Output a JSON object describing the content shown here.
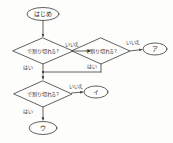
{
  "diagram": {
    "type": "flowchart",
    "title": "",
    "language": "ja",
    "style": {
      "stroke_color": "#3a3a3a",
      "text_color": "#2b2b2b",
      "background_color": "#fdfdfc",
      "stroke_width": 0.8
    },
    "nodes": [
      {
        "id": "start",
        "shape": "oval",
        "label": "はじめ",
        "x": 43,
        "y": 14,
        "rx": 16,
        "ry": 6.5
      },
      {
        "id": "decision1",
        "shape": "diamond",
        "label": "で割り切れる?",
        "x": 43,
        "y": 51,
        "rx": 30,
        "ry": 13
      },
      {
        "id": "decision2",
        "shape": "diamond",
        "label": "で割り切れる?",
        "x": 101,
        "y": 51,
        "rx": 29,
        "ry": 13
      },
      {
        "id": "answer-a",
        "shape": "oval",
        "label": "ア",
        "x": 155,
        "y": 49,
        "rx": 12,
        "ry": 6
      },
      {
        "id": "decision3",
        "shape": "diamond",
        "label": "で割り切れる?",
        "x": 43,
        "y": 94,
        "rx": 29,
        "ry": 13
      },
      {
        "id": "answer-i",
        "shape": "oval",
        "label": "イ",
        "x": 96,
        "y": 92,
        "rx": 12,
        "ry": 6
      },
      {
        "id": "answer-u",
        "shape": "oval",
        "label": "ウ",
        "x": 43,
        "y": 128,
        "rx": 14,
        "ry": 6.5
      }
    ],
    "edges": [
      {
        "id": "e-start-d1",
        "from": "start",
        "to": "decision1",
        "label": ""
      },
      {
        "id": "e-d1-no-d2",
        "from": "decision1",
        "to": "decision2",
        "label": "いいえ",
        "label_x": 72,
        "label_y": 44
      },
      {
        "id": "e-d2-no-a",
        "from": "decision2",
        "to": "answer-a",
        "label": "いいえ",
        "label_x": 133,
        "label_y": 42
      },
      {
        "id": "e-d1-yes-merge",
        "from": "decision1",
        "to": "merge",
        "label": "はい",
        "label_x": 28,
        "label_y": 67
      },
      {
        "id": "e-d2-yes-merge",
        "from": "decision2",
        "to": "merge",
        "label": "はい",
        "label_x": 92,
        "label_y": 66
      },
      {
        "id": "e-merge-d3",
        "from": "merge",
        "to": "decision3",
        "label": ""
      },
      {
        "id": "e-d3-no-i",
        "from": "decision3",
        "to": "answer-i",
        "label": "いいえ",
        "label_x": 76,
        "label_y": 86
      },
      {
        "id": "e-d3-yes-u",
        "from": "decision3",
        "to": "answer-u",
        "label": "はい",
        "label_x": 28,
        "label_y": 111
      }
    ]
  }
}
